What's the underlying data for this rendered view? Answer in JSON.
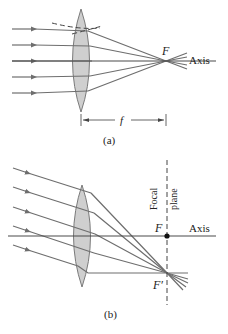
{
  "panel_a": {
    "caption": "(a)",
    "focal_label": "F",
    "axis_label": "Axis",
    "focal_length_label": "f",
    "ray_count": 5,
    "description": "Parallel rays along the axis converge at focal point F"
  },
  "panel_b": {
    "caption": "(b)",
    "focal_label": "F",
    "off_axis_focal_label": "F′",
    "axis_label": "Axis",
    "focal_plane_label_line1": "Focal",
    "focal_plane_label_line2": "plane",
    "ray_count": 5,
    "description": "Parallel rays at an angle converge at F′ in the focal plane"
  },
  "colors": {
    "ray": "#6e6e6e",
    "lens_fill": "#cfcfcf",
    "axis": "#4a4a4a",
    "background": "#ffffff"
  }
}
